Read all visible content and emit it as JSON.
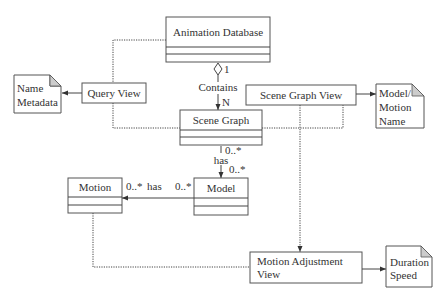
{
  "diagram": {
    "type": "UML class diagram",
    "classes": [
      {
        "id": "animation_db",
        "name": "Animation Database"
      },
      {
        "id": "scene_graph",
        "name": "Scene Graph"
      },
      {
        "id": "model",
        "name": "Model"
      },
      {
        "id": "motion",
        "name": "Motion"
      }
    ],
    "views": [
      {
        "id": "query_view",
        "name": "Query View"
      },
      {
        "id": "scene_graph_view",
        "name": "Scene Graph View"
      },
      {
        "id": "motion_adjustment_view",
        "name_line1": "Motion Adjustment",
        "name_line2": "View"
      }
    ],
    "notes": [
      {
        "id": "name_metadata",
        "line1": "Name",
        "line2": "Metadata"
      },
      {
        "id": "model_motion_name",
        "line1": "Model/",
        "line2": "Motion",
        "line3": "Name"
      },
      {
        "id": "duration_speed",
        "line1": "Duration",
        "line2": "Speed"
      }
    ],
    "relations": {
      "contains": {
        "label": "Contains",
        "source_mult": "1",
        "target_mult": "N"
      },
      "sg_has_model": {
        "label": "has",
        "source_mult": "0..*",
        "target_mult": "0..*"
      },
      "model_has_motion": {
        "label": "has",
        "source_mult": "0..*",
        "target_mult": "0..*"
      }
    }
  }
}
